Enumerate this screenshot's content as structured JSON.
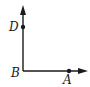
{
  "diagram": {
    "type": "geometry-rays",
    "colors": {
      "stroke": "#1a1a1a",
      "background": "#ffffff"
    },
    "points": [
      {
        "id": "D",
        "label": "D",
        "x": 23,
        "y": 27
      },
      {
        "id": "B",
        "label": "B",
        "x": 23,
        "y": 71
      },
      {
        "id": "A",
        "label": "A",
        "x": 69,
        "y": 71
      }
    ],
    "rays": [
      {
        "from": "B",
        "through": "D",
        "direction": "up"
      },
      {
        "from": "B",
        "through": "A",
        "direction": "right"
      }
    ]
  }
}
